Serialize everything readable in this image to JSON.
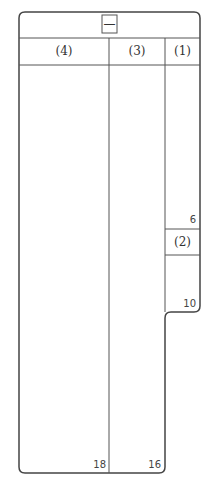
{
  "header": {
    "symbol": "—"
  },
  "columns": [
    {
      "label": "(4)",
      "end_number": "18"
    },
    {
      "label": "(3)",
      "end_number": "16"
    },
    {
      "label": "(1)",
      "end_number": "6"
    }
  ],
  "sub_cell": {
    "label": "(2)",
    "end_number": "10"
  }
}
